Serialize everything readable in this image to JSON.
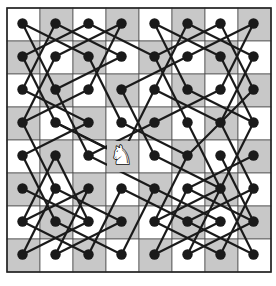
{
  "diagram": {
    "board": {
      "size": 8,
      "origin_x": 7,
      "origin_y": 8,
      "cell": 33,
      "light_color": "#ffffff",
      "dark_color": "#c8c8c8",
      "border_color": "#222222",
      "grid_color": "#555555",
      "top_left_is_light": true
    },
    "dot": {
      "radius": 5.2,
      "color": "#1a1a1a",
      "offset_x": 0,
      "offset_y": 0
    },
    "line": {
      "color": "#1a1a1a",
      "width": 2.2
    },
    "knight": {
      "col": 3,
      "row": 4,
      "glyph": "♞",
      "color": "#ffffff",
      "outline": "#111111"
    },
    "tour_edges": [
      [
        [
          0,
          0
        ],
        [
          2,
          1
        ]
      ],
      [
        [
          0,
          0
        ],
        [
          1,
          2
        ]
      ],
      [
        [
          1,
          0
        ],
        [
          3,
          1
        ]
      ],
      [
        [
          1,
          0
        ],
        [
          0,
          2
        ]
      ],
      [
        [
          2,
          0
        ],
        [
          0,
          1
        ]
      ],
      [
        [
          2,
          0
        ],
        [
          4,
          1
        ]
      ],
      [
        [
          3,
          0
        ],
        [
          1,
          1
        ]
      ],
      [
        [
          3,
          0
        ],
        [
          2,
          2
        ]
      ],
      [
        [
          4,
          0
        ],
        [
          6,
          1
        ]
      ],
      [
        [
          4,
          0
        ],
        [
          5,
          2
        ]
      ],
      [
        [
          5,
          0
        ],
        [
          7,
          1
        ]
      ],
      [
        [
          5,
          0
        ],
        [
          4,
          2
        ]
      ],
      [
        [
          6,
          0
        ],
        [
          4,
          1
        ]
      ],
      [
        [
          6,
          0
        ],
        [
          7,
          2
        ]
      ],
      [
        [
          7,
          0
        ],
        [
          5,
          1
        ]
      ],
      [
        [
          7,
          0
        ],
        [
          6,
          2
        ]
      ],
      [
        [
          0,
          1
        ],
        [
          1,
          3
        ]
      ],
      [
        [
          1,
          1
        ],
        [
          0,
          3
        ]
      ],
      [
        [
          2,
          1
        ],
        [
          3,
          3
        ]
      ],
      [
        [
          3,
          1
        ],
        [
          1,
          2
        ]
      ],
      [
        [
          5,
          1
        ],
        [
          3,
          2
        ]
      ],
      [
        [
          6,
          1
        ],
        [
          7,
          3
        ]
      ],
      [
        [
          7,
          1
        ],
        [
          6,
          3
        ]
      ],
      [
        [
          4,
          1
        ],
        [
          5,
          3
        ]
      ],
      [
        [
          0,
          2
        ],
        [
          2,
          3
        ]
      ],
      [
        [
          1,
          2
        ],
        [
          2,
          4
        ]
      ],
      [
        [
          2,
          2
        ],
        [
          0,
          3
        ]
      ],
      [
        [
          3,
          2
        ],
        [
          4,
          4
        ]
      ],
      [
        [
          4,
          2
        ],
        [
          6,
          3
        ]
      ],
      [
        [
          5,
          2
        ],
        [
          7,
          3
        ]
      ],
      [
        [
          6,
          2
        ],
        [
          4,
          3
        ]
      ],
      [
        [
          7,
          2
        ],
        [
          5,
          4
        ]
      ],
      [
        [
          0,
          3
        ],
        [
          1,
          5
        ]
      ],
      [
        [
          1,
          3
        ],
        [
          3,
          4
        ]
      ],
      [
        [
          2,
          3
        ],
        [
          0,
          4
        ]
      ],
      [
        [
          3,
          3
        ],
        [
          5,
          4
        ]
      ],
      [
        [
          4,
          3
        ],
        [
          2,
          4
        ]
      ],
      [
        [
          5,
          3
        ],
        [
          6,
          5
        ]
      ],
      [
        [
          6,
          3
        ],
        [
          7,
          5
        ]
      ],
      [
        [
          7,
          3
        ],
        [
          6,
          5
        ]
      ],
      [
        [
          0,
          4
        ],
        [
          1,
          6
        ]
      ],
      [
        [
          1,
          4
        ],
        [
          0,
          6
        ]
      ],
      [
        [
          2,
          4
        ],
        [
          4,
          5
        ]
      ],
      [
        [
          4,
          4
        ],
        [
          6,
          5
        ]
      ],
      [
        [
          5,
          4
        ],
        [
          4,
          6
        ]
      ],
      [
        [
          6,
          4
        ],
        [
          7,
          6
        ]
      ],
      [
        [
          7,
          4
        ],
        [
          5,
          5
        ]
      ],
      [
        [
          1,
          4
        ],
        [
          2,
          6
        ]
      ],
      [
        [
          0,
          5
        ],
        [
          2,
          6
        ]
      ],
      [
        [
          1,
          5
        ],
        [
          3,
          6
        ]
      ],
      [
        [
          2,
          5
        ],
        [
          0,
          6
        ]
      ],
      [
        [
          3,
          5
        ],
        [
          5,
          6
        ]
      ],
      [
        [
          4,
          5
        ],
        [
          6,
          6
        ]
      ],
      [
        [
          5,
          5
        ],
        [
          7,
          6
        ]
      ],
      [
        [
          6,
          5
        ],
        [
          4,
          6
        ]
      ],
      [
        [
          7,
          5
        ],
        [
          5,
          6
        ]
      ],
      [
        [
          0,
          6
        ],
        [
          2,
          7
        ]
      ],
      [
        [
          1,
          6
        ],
        [
          3,
          7
        ]
      ],
      [
        [
          2,
          6
        ],
        [
          0,
          7
        ]
      ],
      [
        [
          3,
          6
        ],
        [
          1,
          7
        ]
      ],
      [
        [
          4,
          6
        ],
        [
          6,
          7
        ]
      ],
      [
        [
          5,
          6
        ],
        [
          7,
          7
        ]
      ],
      [
        [
          6,
          6
        ],
        [
          4,
          7
        ]
      ],
      [
        [
          7,
          6
        ],
        [
          5,
          7
        ]
      ],
      [
        [
          0,
          7
        ],
        [
          1,
          5
        ]
      ],
      [
        [
          2,
          7
        ],
        [
          3,
          5
        ]
      ],
      [
        [
          4,
          7
        ],
        [
          5,
          5
        ]
      ],
      [
        [
          6,
          7
        ],
        [
          7,
          5
        ]
      ],
      [
        [
          1,
          7
        ],
        [
          2,
          5
        ]
      ],
      [
        [
          3,
          7
        ],
        [
          4,
          5
        ]
      ],
      [
        [
          5,
          7
        ],
        [
          6,
          5
        ]
      ],
      [
        [
          7,
          7
        ],
        [
          6,
          5
        ]
      ],
      [
        [
          3,
          4
        ],
        [
          1,
          3
        ]
      ],
      [
        [
          3,
          4
        ],
        [
          4,
          2
        ]
      ]
    ]
  }
}
